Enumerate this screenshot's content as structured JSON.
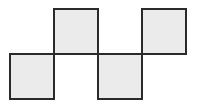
{
  "diagram": {
    "type": "net",
    "stroke_color": "#2a2a2a",
    "fill_color": "#ebebeb",
    "squares": [
      {
        "id": "square-1",
        "row": "bottom",
        "x": 9,
        "y": 53,
        "size": 46
      },
      {
        "id": "square-2",
        "row": "top",
        "x": 53,
        "y": 8,
        "size": 46
      },
      {
        "id": "square-3",
        "row": "bottom",
        "x": 97,
        "y": 53,
        "size": 46
      },
      {
        "id": "square-4",
        "row": "top",
        "x": 141,
        "y": 8,
        "size": 46
      }
    ]
  }
}
